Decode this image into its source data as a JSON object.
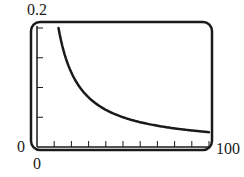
{
  "chart_data": {
    "type": "line",
    "title": "",
    "xlabel": "",
    "ylabel": "",
    "xlim": [
      0,
      100
    ],
    "ylim": [
      0,
      0.2
    ],
    "x_tick_labels": [
      "0",
      "100"
    ],
    "y_tick_labels": [
      "0",
      "0.2"
    ],
    "x_ticks": [
      10,
      20,
      30,
      40,
      50,
      60,
      70,
      80,
      90,
      100
    ],
    "y_ticks": [
      0.05,
      0.1,
      0.15,
      0.2
    ],
    "grid": false,
    "legend": null,
    "series": [
      {
        "name": "y = 2.5/x",
        "x": [
          12.5,
          15,
          20,
          25,
          30,
          40,
          50,
          60,
          70,
          80,
          90,
          100
        ],
        "values": [
          0.2,
          0.167,
          0.125,
          0.1,
          0.083,
          0.0625,
          0.05,
          0.042,
          0.036,
          0.031,
          0.028,
          0.025
        ]
      }
    ]
  },
  "labels": {
    "y_max": "0.2",
    "y_min": "0",
    "x_min": "0",
    "x_max": "100"
  },
  "colors": {
    "stroke": "#1a1a1a"
  }
}
